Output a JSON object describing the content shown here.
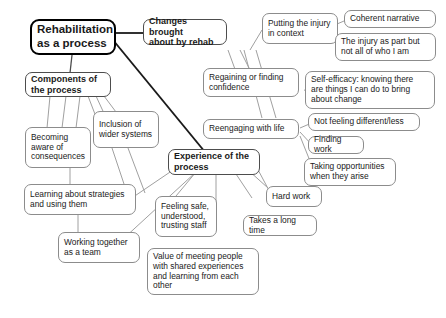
{
  "diagram": {
    "background_color": "#ffffff",
    "root_border_color": "#000000",
    "node_border_color": "#8c8c8c",
    "edge_color": "#a0a0a0",
    "root_edge_color": "#1a1a1a",
    "text_color": "#1a1a1a"
  },
  "nodes": {
    "root": "Rehabilitation\nas a process",
    "components": "Components of\nthe process",
    "changes": "Changes brought\nabout by rehab",
    "experience": "Experience of the\nprocess",
    "becoming_aware": "Becoming\naware of\nconsequences",
    "inclusion": "Inclusion of\nwider systems",
    "learning_strategies": "Learning about strategies\nand using them",
    "working_together": "Working together\nas a team",
    "putting_injury": "Putting the injury\nin context",
    "coherent_narrative": "Coherent narrative",
    "injury_part": "The injury as part but\nnot all of who I am",
    "regaining_confidence": "Regaining or finding\nconfidence",
    "self_efficacy": "Self-efficacy: knowing there\nare things I can do to bring\nabout change",
    "reengaging": "Reengaging with life",
    "not_feeling_different": "Not feeling different/less",
    "finding_work": "Finding work",
    "taking_opportunities": "Taking opportunities\nwhen they arise",
    "feeling_safe": "Feeling safe,\nunderstood,\ntrusting staff",
    "hard_work": "Hard work",
    "takes_long_time": "Takes a long time",
    "value_meeting": "Value of meeting people\nwith shared experiences\nand learning from each\nother"
  }
}
